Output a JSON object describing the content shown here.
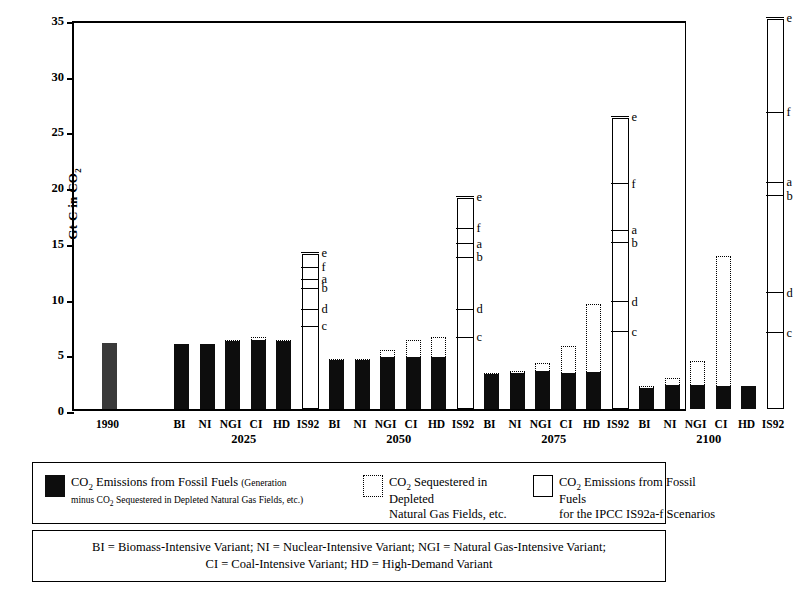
{
  "axis": {
    "ylabel": "Gt C in CO",
    "ylabel_sub": "2",
    "yticks": [
      "35",
      "30",
      "25",
      "20",
      "15",
      "10",
      "5",
      "0"
    ]
  },
  "groups": [
    {
      "name": "1990",
      "bar_labels": [
        "1990"
      ],
      "group_label": ""
    },
    {
      "name": "2025",
      "bar_labels": [
        "BI",
        "NI",
        "NGI",
        "CI",
        "HD",
        "IS92"
      ],
      "group_label": "2025"
    },
    {
      "name": "2050",
      "bar_labels": [
        "BI",
        "NI",
        "NGI",
        "CI",
        "HD",
        "IS92"
      ],
      "group_label": "2050"
    },
    {
      "name": "2075",
      "bar_labels": [
        "BI",
        "NI",
        "NGI",
        "CI",
        "HD",
        "IS92"
      ],
      "group_label": "2075"
    },
    {
      "name": "2100",
      "bar_labels": [
        "BI",
        "NI",
        "NGI",
        "CI",
        "HD",
        "IS92"
      ],
      "group_label": "2100"
    }
  ],
  "legend": {
    "items": [
      {
        "swatch": "solid-black-box",
        "line1": "CO",
        "line1_sub": "2",
        "line1_rest": " Emissions from Fossil Fuels ",
        "line1_small": "(Generation",
        "line2_small_a": "minus CO",
        "line2_small_sub": "2",
        "line2_small_b": " Sequestered in Depleted Natural Gas Fields, etc.)"
      },
      {
        "swatch": "dotted-open-box",
        "line1": "CO",
        "line1_sub": "2",
        "line1_rest": " Sequestered in Depleted",
        "line2": "Natural Gas Fields, etc."
      },
      {
        "swatch": "solid-open-box",
        "line1": "CO",
        "line1_sub": "2",
        "line1_rest": " Emissions from Fossil Fuels",
        "line2": "for the IPCC IS92a-f Scenarios"
      }
    ],
    "variants_line1": "BI = Biomass-Intensive Variant; NI = Nuclear-Intensive Variant; NGI = Natural Gas-Intensive Variant;",
    "variants_line2": "CI = Coal-Intensive Variant; HD = High-Demand Variant"
  },
  "colors": {
    "solid_fill": "#0d0d0d",
    "grey_fill": "#3a3a3a",
    "line": "#000000",
    "background": "#ffffff"
  },
  "chart_data": {
    "type": "bar",
    "title": "",
    "xlabel": "",
    "ylabel": "Gt C in CO2",
    "ylim": [
      0,
      35
    ],
    "ytick_values": [
      0,
      5,
      10,
      15,
      20,
      25,
      30,
      35
    ],
    "grid": false,
    "legend_position": "below-plot",
    "units": "Gt C in CO2",
    "series": [
      {
        "name": "CO2 Emissions from Fossil Fuels (Generation minus CO2 Sequestered in Depleted Natural Gas Fields, etc.)",
        "style": "solid-black"
      },
      {
        "name": "CO2 Sequestered in Depleted Natural Gas Fields, etc.",
        "style": "dotted-outline-stacked"
      },
      {
        "name": "CO2 Emissions from Fossil Fuels for the IPCC IS92a-f Scenarios",
        "style": "open-range-box"
      }
    ],
    "groups": [
      {
        "period": "1990",
        "bars": [
          {
            "label": "1990",
            "emissions": 5.9,
            "sequestered": 0.0
          }
        ]
      },
      {
        "period": "2025",
        "bars": [
          {
            "label": "BI",
            "emissions": 5.8,
            "sequestered": 0.0
          },
          {
            "label": "NI",
            "emissions": 5.8,
            "sequestered": 0.0
          },
          {
            "label": "NGI",
            "emissions": 6.1,
            "sequestered": 0.1
          },
          {
            "label": "CI",
            "emissions": 6.2,
            "sequestered": 0.3
          },
          {
            "label": "HD",
            "emissions": 6.1,
            "sequestered": 0.1
          }
        ],
        "is92_range": {
          "label": "IS92",
          "min": 7.3,
          "max": 13.9,
          "markers": [
            {
              "scenario": "c",
              "value": 7.3
            },
            {
              "scenario": "d",
              "value": 8.8
            },
            {
              "scenario": "b",
              "value": 10.7
            },
            {
              "scenario": "a",
              "value": 11.5
            },
            {
              "scenario": "f",
              "value": 12.6
            },
            {
              "scenario": "e",
              "value": 13.9
            }
          ]
        }
      },
      {
        "period": "2050",
        "bars": [
          {
            "label": "BI",
            "emissions": 4.4,
            "sequestered": 0.1
          },
          {
            "label": "NI",
            "emissions": 4.4,
            "sequestered": 0.1
          },
          {
            "label": "NGI",
            "emissions": 4.7,
            "sequestered": 0.6
          },
          {
            "label": "CI",
            "emissions": 4.7,
            "sequestered": 1.5
          },
          {
            "label": "HD",
            "emissions": 4.7,
            "sequestered": 1.8
          }
        ],
        "is92_range": {
          "label": "IS92",
          "min": 6.3,
          "max": 18.9,
          "markers": [
            {
              "scenario": "c",
              "value": 6.3
            },
            {
              "scenario": "d",
              "value": 8.8
            },
            {
              "scenario": "b",
              "value": 13.5
            },
            {
              "scenario": "a",
              "value": 14.7
            },
            {
              "scenario": "f",
              "value": 16.1
            },
            {
              "scenario": "e",
              "value": 18.9
            }
          ]
        }
      },
      {
        "period": "2075",
        "bars": [
          {
            "label": "BI",
            "emissions": 3.1,
            "sequestered": 0.1
          },
          {
            "label": "NI",
            "emissions": 3.2,
            "sequestered": 0.2
          },
          {
            "label": "NGI",
            "emissions": 3.4,
            "sequestered": 0.7
          },
          {
            "label": "CI",
            "emissions": 3.2,
            "sequestered": 2.5
          },
          {
            "label": "HD",
            "emissions": 3.3,
            "sequestered": 6.1
          }
        ],
        "is92_range": {
          "label": "IS92",
          "min": 6.8,
          "max": 26.1,
          "markers": [
            {
              "scenario": "c",
              "value": 6.8
            },
            {
              "scenario": "d",
              "value": 9.5
            },
            {
              "scenario": "b",
              "value": 14.8
            },
            {
              "scenario": "a",
              "value": 15.9
            },
            {
              "scenario": "f",
              "value": 20.1
            },
            {
              "scenario": "e",
              "value": 26.1
            }
          ]
        }
      },
      {
        "period": "2100",
        "bars": [
          {
            "label": "BI",
            "emissions": 1.9,
            "sequestered": 0.2
          },
          {
            "label": "NI",
            "emissions": 2.2,
            "sequestered": 0.6
          },
          {
            "label": "NGI",
            "emissions": 2.2,
            "sequestered": 2.1
          },
          {
            "label": "CI",
            "emissions": 2.1,
            "sequestered": 11.6
          },
          {
            "label": "HD",
            "emissions": 2.1,
            "sequestered": 0.0
          }
        ],
        "is92_range": {
          "label": "IS92",
          "min": 6.7,
          "max": 35.0,
          "markers": [
            {
              "scenario": "c",
              "value": 6.7
            },
            {
              "scenario": "d",
              "value": 10.3
            },
            {
              "scenario": "b",
              "value": 19.0
            },
            {
              "scenario": "a",
              "value": 20.2
            },
            {
              "scenario": "f",
              "value": 26.5
            },
            {
              "scenario": "e",
              "value": 35.0
            }
          ]
        }
      }
    ]
  }
}
